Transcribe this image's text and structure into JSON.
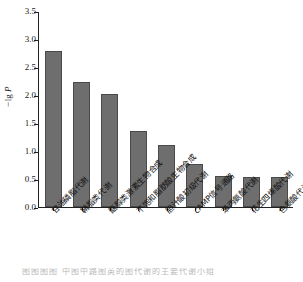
{
  "chart_data": {
    "type": "bar",
    "title": "",
    "xlabel": "",
    "ylabel": "-lg P",
    "ylabel_parts": {
      "minus": "−",
      "lg": "lg",
      "p": "P"
    },
    "categories": [
      "甘油磷脂代谢",
      "鞘脂类代谢",
      "甑醇类激素生物合成",
      "不饱和脂肪酸生物合成",
      "胆汁酸初级代谢",
      "cAMP信号通路",
      "苯丙氨酸代谢",
      "花生四烯酸代谢",
      "色氨酸代谢"
    ],
    "values": [
      2.8,
      2.25,
      2.02,
      1.36,
      1.12,
      0.78,
      0.55,
      0.54,
      0.53
    ],
    "ylim": [
      0.0,
      3.5
    ],
    "ytick_labels": [
      "0.0",
      "0.5",
      "1.0",
      "1.5",
      "2.0",
      "2.5",
      "3.0",
      "3.5"
    ],
    "ytick_values": [
      0.0,
      0.5,
      1.0,
      1.5,
      2.0,
      2.5,
      3.0,
      3.5
    ],
    "grid": false,
    "legend": null,
    "bar_color": "#6e6e6e",
    "bar_edge_color": "#4a4a4a",
    "axis_color": "#222222"
  },
  "page_bleed": {
    "text": "图图图图    中图中路图英的图代谢的主要代谢小组"
  }
}
